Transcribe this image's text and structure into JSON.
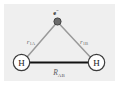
{
  "figure": {
    "name": "hydrogen-molecule-coordinates",
    "background_color": "#ffffff",
    "panel_color": "#efefef"
  },
  "electron": {
    "symbol": "e",
    "charge_superscript": "−",
    "dot_color": "#6b6b6b",
    "dot_edge_color": "#3a3a3a",
    "label_color": "#2b2b2b"
  },
  "atoms": [
    {
      "id": "atom-a",
      "label": "H",
      "side": "left"
    },
    {
      "id": "atom-b",
      "label": "H",
      "side": "right"
    }
  ],
  "atom_style": {
    "fill": "#ffffff",
    "stroke": "#3c3c3c",
    "label_color": "#1a1a1a"
  },
  "distances": [
    {
      "id": "electron-to-a",
      "symbol": "r",
      "subscript": "1A",
      "line_color": "#9a9a9a",
      "label_color": "#6d6d6d"
    },
    {
      "id": "electron-to-b",
      "symbol": "r",
      "subscript": "1B",
      "line_color": "#9a9a9a",
      "label_color": "#6d6d6d"
    }
  ],
  "bond": {
    "id": "internuclear-axis",
    "symbol": "R",
    "subscript": "AB",
    "line_color": "#121212",
    "label_color": "#5c5c5c"
  }
}
